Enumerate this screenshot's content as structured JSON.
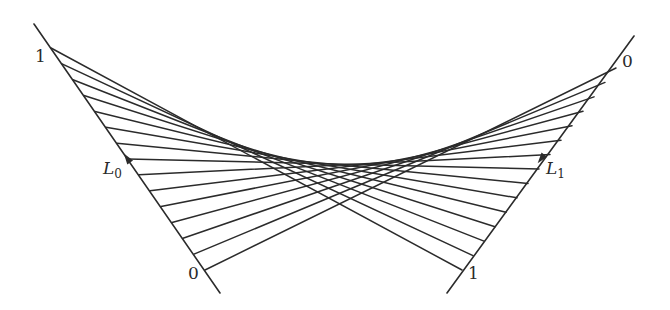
{
  "diagram": {
    "title": "",
    "stroke_color": "#2b2b2b",
    "segment_count": 15,
    "lines": {
      "L0": {
        "name": "L",
        "subscript": "0",
        "extended_start": [
          34,
          24
        ],
        "extended_end": [
          220,
          293
        ],
        "t0_point": [
          205,
          270
        ],
        "t1_point": [
          51,
          48
        ],
        "arrow_at": [
          127,
          158
        ],
        "arrow_direction": "toward t=1 (up-left)"
      },
      "L1": {
        "name": "L",
        "subscript": "1",
        "extended_start": [
          634,
          36
        ],
        "extended_end": [
          447,
          293
        ],
        "t0_point": [
          616,
          68
        ],
        "t1_point": [
          462,
          270
        ],
        "arrow_at": [
          541,
          159
        ],
        "arrow_direction": "toward t=1 (down-left)"
      }
    },
    "labels": {
      "L0_top": "1",
      "L0_bottom": "0",
      "L1_top": "0",
      "L1_bottom": "1",
      "L0_name": "L",
      "L0_sub": "0",
      "L1_name": "L",
      "L1_sub": "1"
    }
  }
}
